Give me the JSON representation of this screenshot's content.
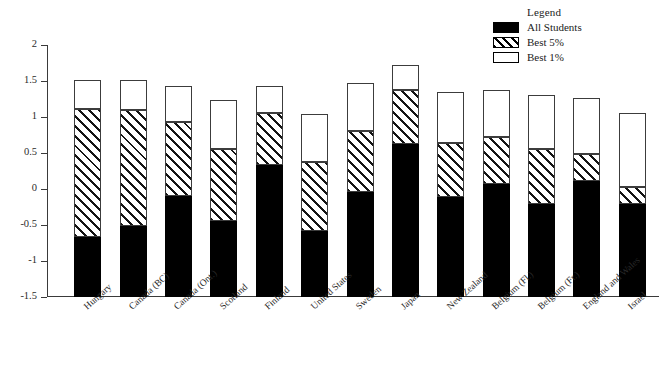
{
  "legend": {
    "title": "Legend",
    "items": [
      {
        "label": "All Students",
        "swatch": "solid-black-icon"
      },
      {
        "label": "Best 5%",
        "swatch": "hatched-icon"
      },
      {
        "label": "Best 1%",
        "swatch": "open-white-icon"
      }
    ]
  },
  "axis": {
    "y_ticks": [
      "2",
      "1.5",
      "1",
      "0.5",
      "0",
      "-0.5",
      "-1",
      "-1.5"
    ]
  },
  "chart_data": {
    "type": "bar",
    "title": "",
    "subtitle": "",
    "xlabel": "",
    "ylabel": "",
    "ylim": [
      -1.5,
      2
    ],
    "ytick_values": [
      2,
      1.5,
      1,
      0.5,
      0,
      -0.5,
      -1,
      -1.5
    ],
    "grid": false,
    "legend_position": "top-right",
    "stacked": true,
    "note": "Each bar spans from the 'All Students' mean (bottom of bar) up to the 'Best 1%' top. Values are standardized scores; segment boundaries read off the axis.",
    "categories": [
      "Hungary",
      "Canada (BC)",
      "Canada (Ont.)",
      "Scotland",
      "Finland",
      "United States",
      "Sweden",
      "Japan",
      "New Zealand",
      "Belgium (Fl.)",
      "Belgium (Fr.)",
      "England and Wales",
      "Israel"
    ],
    "series": [
      {
        "name": "All Students",
        "values": [
          -0.67,
          -0.52,
          -0.1,
          -0.44,
          0.33,
          -0.58,
          -0.04,
          0.62,
          -0.11,
          0.07,
          -0.21,
          0.11,
          -0.21
        ]
      },
      {
        "name": "Best 5%",
        "values": [
          1.11,
          1.1,
          0.93,
          0.55,
          1.06,
          0.38,
          0.81,
          1.38,
          0.64,
          0.72,
          0.55,
          0.48,
          0.03
        ]
      },
      {
        "name": "Best 1%",
        "values": [
          1.52,
          1.52,
          1.43,
          1.24,
          1.43,
          1.04,
          1.47,
          1.72,
          1.35,
          1.38,
          1.3,
          1.27,
          1.05
        ]
      }
    ]
  }
}
